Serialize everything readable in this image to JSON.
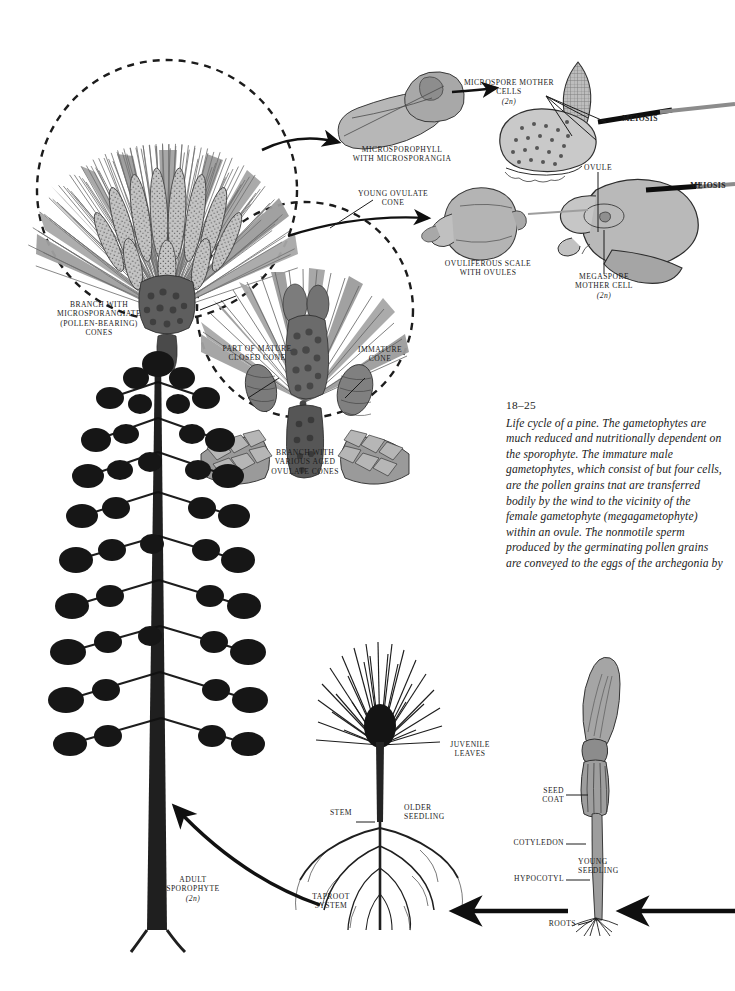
{
  "figure": {
    "number": "18–25",
    "caption": "Life cycle of a pine. The gametophytes are much reduced and nutritionally dependent on the sporophyte. The immature male gametophytes, which consist of but four cells, are the pollen grains tnat are transferred bodily by the wind to the vicinity of the female gametophyte (megagametophyte) within an ovule. The nonmotile sperm produced by the germinating pollen grains are conveyed to the eggs of the archegonia by"
  },
  "labels": {
    "branch_microsporangiate": "BRANCH WITH\nMICROSPORANGIATE\n(POLLEN-BEARING)\nCONES",
    "microsporophyll": "MICROSPOROPHYLL\nWITH MICROSPORANGIA",
    "microspore_mother_cells": "MICROSPORE MOTHER\nCELLS",
    "microspore_ploidy": "(2n)",
    "meiosis_top": "MEIOSIS",
    "young_ovulate_cone": "YOUNG OVULATE\nCONE",
    "ovuliferous_scale": "OVULIFEROUS SCALE\nWITH OVULES",
    "ovule": "OVULE",
    "megaspore_mother_cell": "MEGASPORE\nMOTHER CELL",
    "megaspore_ploidy": "(2n)",
    "meiosis_bottom": "MEIOSIS",
    "part_of_mature_closed_cone": "PART OF MATURE\nCLOSED CONE",
    "immature_cone": "IMMATURE\nCONE",
    "branch_ovulate": "BRANCH WITH\nVARIOUS AGED\nOVULATE CONES",
    "adult_sporophyte": "ADULT\nSPOROPHYTE",
    "adult_ploidy": "(2n)",
    "juvenile_leaves": "JUVENILE\nLEAVES",
    "stem": "STEM",
    "older_seedling": "OLDER\nSEEDLING",
    "taproot_system": "TAPROOT\nSYSTEM",
    "seed_coat": "SEED\nCOAT",
    "cotyledon": "COTYLEDON",
    "hypocotyl": "HYPOCOTYL",
    "young_seedling": "YOUNG\nSEEDLING",
    "roots": "ROOTS"
  },
  "colors": {
    "ink": "#1c1c1c",
    "paper": "#ffffff",
    "tissue_light": "#cfcfcf",
    "tissue_mid": "#b3b3b3",
    "tissue_dark": "#8f8f8f",
    "needle": "#9a9a9a",
    "cone_dark": "#555555"
  }
}
